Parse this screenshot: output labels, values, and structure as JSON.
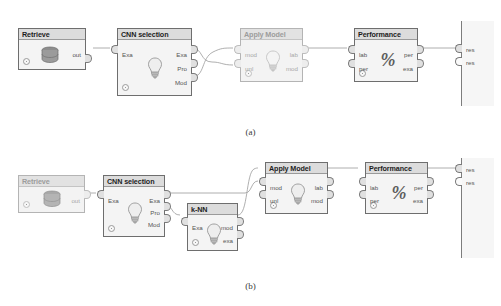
{
  "figure": {
    "caption_a": "(a)",
    "caption_b": "(b)",
    "icons": {
      "bulb": "lightbulb-icon",
      "database": "database-icon",
      "percent": "percent-icon",
      "breakpoint": "status-circle-icon"
    },
    "colors": {
      "node_border": "#6e6e6e",
      "node_fill": "#f4f4f4",
      "title_fill": "#dcdcdc",
      "wire": "#9b9b9b",
      "faded_border": "#b4b4b4",
      "faded_text": "#9c9c9c",
      "label_text": "#555555"
    }
  },
  "diagram_a": {
    "nodes": [
      {
        "id": "retrieve",
        "title": "Retrieve",
        "icon": "database-icon",
        "faded": false,
        "inputs": [],
        "outputs": [
          "out"
        ]
      },
      {
        "id": "cnn-selection",
        "title": "CNN selection",
        "icon": "lightbulb-icon",
        "faded": false,
        "inputs": [
          "Exa"
        ],
        "outputs": [
          "Exa",
          "Pro",
          "Mod"
        ]
      },
      {
        "id": "apply-model",
        "title": "Apply Model",
        "icon": "lightbulb-icon",
        "faded": true,
        "inputs": [
          "mod",
          "unl"
        ],
        "outputs": [
          "lab",
          "mod"
        ]
      },
      {
        "id": "performance",
        "title": "Performance",
        "icon": "percent-icon",
        "faded": false,
        "inputs": [
          "lab",
          "per"
        ],
        "outputs": [
          "per",
          "exa"
        ]
      }
    ],
    "result_panel": {
      "ports": [
        "res",
        "res"
      ]
    },
    "connections": [
      {
        "from": "retrieve.out",
        "to": "cnn-selection.Exa"
      },
      {
        "from": "cnn-selection.Exa",
        "to": "apply-model.unl"
      },
      {
        "from": "cnn-selection.Mod",
        "to": "apply-model.mod"
      },
      {
        "from": "apply-model.lab",
        "to": "performance.lab"
      },
      {
        "from": "performance.per",
        "to": "result.res"
      }
    ]
  },
  "diagram_b": {
    "nodes": [
      {
        "id": "retrieve",
        "title": "Retrieve",
        "icon": "database-icon",
        "faded": true,
        "inputs": [],
        "outputs": [
          "out"
        ]
      },
      {
        "id": "cnn-selection",
        "title": "CNN selection",
        "icon": "lightbulb-icon",
        "faded": false,
        "inputs": [
          "Exa"
        ],
        "outputs": [
          "Exa",
          "Pro",
          "Mod"
        ]
      },
      {
        "id": "k-nn",
        "title": "k-NN",
        "icon": "lightbulb-icon",
        "faded": false,
        "inputs": [
          "Exa"
        ],
        "outputs": [
          "mod",
          "exa"
        ]
      },
      {
        "id": "apply-model",
        "title": "Apply Model",
        "icon": "lightbulb-icon",
        "faded": false,
        "inputs": [
          "mod",
          "unl"
        ],
        "outputs": [
          "lab",
          "mod"
        ]
      },
      {
        "id": "performance",
        "title": "Performance",
        "icon": "percent-icon",
        "faded": false,
        "inputs": [
          "lab",
          "per"
        ],
        "outputs": [
          "per",
          "exa"
        ]
      }
    ],
    "result_panel": {
      "ports": [
        "res",
        "res"
      ]
    },
    "connections": [
      {
        "from": "retrieve.out",
        "to": "cnn-selection.Exa"
      },
      {
        "from": "cnn-selection.Exa",
        "to": "apply-model.unl"
      },
      {
        "from": "cnn-selection.Pro",
        "to": "k-nn.Exa"
      },
      {
        "from": "k-nn.mod",
        "to": "apply-model.mod"
      },
      {
        "from": "apply-model.lab",
        "to": "performance.lab"
      },
      {
        "from": "performance.per",
        "to": "result.res"
      }
    ]
  }
}
